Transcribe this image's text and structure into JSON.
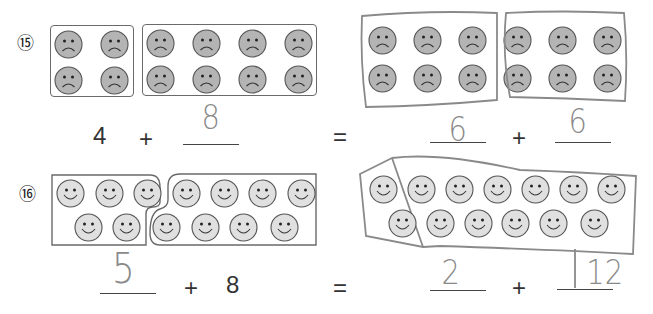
{
  "problems": [
    {
      "number": "⑮",
      "face_type": "frown",
      "face_color": "#b4b4b4",
      "given_groups": [
        4,
        8
      ],
      "equation": {
        "left_a": "4",
        "plus1": "+",
        "left_b_answer": "8",
        "equals": "=",
        "right_a_answer": "6",
        "plus2": "+",
        "right_b_answer": "6"
      }
    },
    {
      "number": "⑯",
      "face_type": "smile",
      "face_color": "#e0e0e0",
      "given_groups": [
        5,
        8
      ],
      "equation": {
        "left_a_answer": "5",
        "plus1": "+",
        "left_b": "8",
        "equals": "=",
        "right_a_answer": "2",
        "plus2": "+",
        "right_b_answer": "12"
      }
    }
  ]
}
